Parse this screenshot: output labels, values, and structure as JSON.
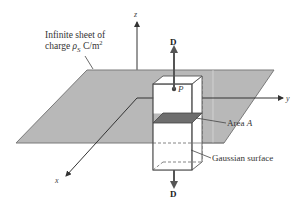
{
  "figure": {
    "sheet_label_line1": "Infinite sheet of",
    "sheet_label_line2_prefix": "charge ",
    "sheet_label_rho": "ρ",
    "sheet_label_sub": "S",
    "sheet_label_units": " C/m",
    "sheet_label_sup": "2",
    "axis_x": "x",
    "axis_y": "y",
    "axis_z": "z",
    "point_label": "P",
    "field_top": "D",
    "field_bottom": "D",
    "area_label_prefix": "Area ",
    "area_label_var": "A",
    "gaussian_label": "Gaussian surface"
  },
  "colors": {
    "plane_fill": "#b8b8b8",
    "plane_stroke": "#7a7a7a",
    "area_fill": "#6e6e6e",
    "axis": "#333333",
    "arrow": "#555555",
    "box_stroke": "#555555",
    "box_fill": "#ffffff"
  }
}
